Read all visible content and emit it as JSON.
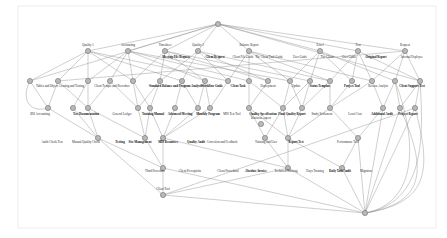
{
  "diagram": {
    "type": "concept-lattice",
    "background_color": "#ffffff",
    "node_fill": "#b9b9b9",
    "node_stroke": "#6e6e6e",
    "edge_color": "#8c8c8c",
    "border_color": "#e8e8e8",
    "node_radius": 2.6,
    "canvas": {
      "width": 447,
      "height": 238
    }
  },
  "layers": [
    {
      "name": "root",
      "y": 24
    },
    {
      "name": "level-1",
      "y": 51
    },
    {
      "name": "level-2",
      "y": 81
    },
    {
      "name": "level-3",
      "y": 108
    },
    {
      "name": "level-4",
      "y": 138
    },
    {
      "name": "level-5",
      "y": 168
    },
    {
      "name": "level-6",
      "y": 195
    },
    {
      "name": "bottom",
      "y": 213
    }
  ],
  "nodes": [
    {
      "id": "n0",
      "x": 218,
      "y": 24,
      "label": ""
    },
    {
      "id": "n1",
      "x": 88,
      "y": 51,
      "label": "Quality 1"
    },
    {
      "id": "n2",
      "x": 128,
      "y": 51,
      "label": "Accounting"
    },
    {
      "id": "n3",
      "x": 165,
      "y": 51,
      "label": "Timesheet"
    },
    {
      "id": "n4",
      "x": 198,
      "y": 51,
      "label": "Quality 2"
    },
    {
      "id": "n5",
      "x": 249,
      "y": 51,
      "label": "Balance Report"
    },
    {
      "id": "n6",
      "x": 320,
      "y": 51,
      "label": "Excel"
    },
    {
      "id": "n7",
      "x": 358,
      "y": 51,
      "label": "Test"
    },
    {
      "id": "n8",
      "x": 405,
      "y": 51,
      "label": "Request"
    },
    {
      "id": "m1",
      "x": 30,
      "y": 81,
      "label": ""
    },
    {
      "id": "m2",
      "x": 58,
      "y": 81,
      "label": ""
    },
    {
      "id": "m3",
      "x": 88,
      "y": 81,
      "label": ""
    },
    {
      "id": "m4",
      "x": 110,
      "y": 81,
      "label": ""
    },
    {
      "id": "m5",
      "x": 133,
      "y": 81,
      "label": ""
    },
    {
      "id": "m6",
      "x": 160,
      "y": 81,
      "label": ""
    },
    {
      "id": "m7",
      "x": 182,
      "y": 81,
      "label": ""
    },
    {
      "id": "m8",
      "x": 205,
      "y": 81,
      "label": ""
    },
    {
      "id": "m9",
      "x": 228,
      "y": 81,
      "label": ""
    },
    {
      "id": "m10",
      "x": 249,
      "y": 81,
      "label": ""
    },
    {
      "id": "m11",
      "x": 268,
      "y": 81,
      "label": ""
    },
    {
      "id": "m12",
      "x": 290,
      "y": 81,
      "label": ""
    },
    {
      "id": "m13",
      "x": 310,
      "y": 81,
      "label": ""
    },
    {
      "id": "m14",
      "x": 330,
      "y": 81,
      "label": ""
    },
    {
      "id": "m15",
      "x": 352,
      "y": 81,
      "label": ""
    },
    {
      "id": "m16",
      "x": 372,
      "y": 81,
      "label": ""
    },
    {
      "id": "m17",
      "x": 395,
      "y": 81,
      "label": ""
    },
    {
      "id": "m18",
      "x": 420,
      "y": 81,
      "label": ""
    },
    {
      "id": "p1",
      "x": 48,
      "y": 108,
      "label": ""
    },
    {
      "id": "p2",
      "x": 73,
      "y": 108,
      "label": ""
    },
    {
      "id": "p3",
      "x": 88,
      "y": 108,
      "label": ""
    },
    {
      "id": "p4",
      "x": 138,
      "y": 108,
      "label": ""
    },
    {
      "id": "p5",
      "x": 150,
      "y": 108,
      "label": ""
    },
    {
      "id": "p6",
      "x": 175,
      "y": 108,
      "label": ""
    },
    {
      "id": "p7",
      "x": 198,
      "y": 108,
      "label": ""
    },
    {
      "id": "p8",
      "x": 210,
      "y": 108,
      "label": ""
    },
    {
      "id": "p9",
      "x": 249,
      "y": 108,
      "label": ""
    },
    {
      "id": "p10",
      "x": 283,
      "y": 108,
      "label": ""
    },
    {
      "id": "p11",
      "x": 302,
      "y": 108,
      "label": ""
    },
    {
      "id": "p12",
      "x": 330,
      "y": 108,
      "label": ""
    },
    {
      "id": "p13",
      "x": 383,
      "y": 108,
      "label": ""
    },
    {
      "id": "p14",
      "x": 400,
      "y": 108,
      "label": ""
    },
    {
      "id": "p15",
      "x": 415,
      "y": 108,
      "label": ""
    },
    {
      "id": "q1",
      "x": 98,
      "y": 138,
      "label": ""
    },
    {
      "id": "q2",
      "x": 145,
      "y": 138,
      "label": ""
    },
    {
      "id": "q3",
      "x": 163,
      "y": 138,
      "label": ""
    },
    {
      "id": "q4",
      "x": 265,
      "y": 138,
      "label": ""
    },
    {
      "id": "q5",
      "x": 288,
      "y": 138,
      "label": ""
    },
    {
      "id": "q6",
      "x": 358,
      "y": 138,
      "label": ""
    },
    {
      "id": "r1",
      "x": 261,
      "y": 124,
      "label": "Business Aspect"
    },
    {
      "id": "s1",
      "x": 163,
      "y": 168,
      "label": ""
    },
    {
      "id": "s2",
      "x": 288,
      "y": 168,
      "label": ""
    },
    {
      "id": "s3",
      "x": 342,
      "y": 168,
      "label": ""
    },
    {
      "id": "t1",
      "x": 163,
      "y": 195,
      "label": "Client Tool"
    },
    {
      "id": "z1",
      "x": 365,
      "y": 213,
      "label": ""
    }
  ],
  "label_rows": [
    {
      "id": "row-top-wide",
      "y": 58,
      "items": [
        {
          "x": 176,
          "text": "Meeting File Request",
          "bold": true
        },
        {
          "x": 215,
          "text": "Client Request",
          "bold": true
        },
        {
          "x": 243,
          "text": "Client File Guide",
          "bold": false
        },
        {
          "x": 269,
          "text": "The Client Task Guide",
          "bold": false
        },
        {
          "x": 300,
          "text": "User Guide",
          "bold": false
        },
        {
          "x": 327,
          "text": "The Client",
          "bold": false
        },
        {
          "x": 349,
          "text": "User Guide",
          "bold": false
        },
        {
          "x": 376,
          "text": "Original Report",
          "bold": true
        },
        {
          "x": 412,
          "text": "Internal Deployee",
          "bold": false
        }
      ]
    },
    {
      "id": "row-mid-wide",
      "y": 87,
      "items": [
        {
          "x": 60,
          "text": "Tables and Object Creating and Testing",
          "bold": false
        },
        {
          "x": 112,
          "text": "Client Temple and Procedure",
          "bold": false
        },
        {
          "x": 155,
          "text": "Standard",
          "bold": true
        },
        {
          "x": 182,
          "text": "Balance and Program Analysis",
          "bold": true
        },
        {
          "x": 212,
          "text": "Workflow Guide",
          "bold": true
        },
        {
          "x": 238,
          "text": "Client Task",
          "bold": true
        },
        {
          "x": 268,
          "text": "Deployment",
          "bold": false
        },
        {
          "x": 296,
          "text": "Update",
          "bold": false
        },
        {
          "x": 320,
          "text": "Status Template",
          "bold": true
        },
        {
          "x": 352,
          "text": "Project Tool",
          "bold": true
        },
        {
          "x": 378,
          "text": "Release Analyst",
          "bold": false
        },
        {
          "x": 412,
          "text": "Client Support Test",
          "bold": true
        }
      ]
    },
    {
      "id": "row-level3",
      "y": 115,
      "items": [
        {
          "x": 40,
          "text": "BIS Accounting",
          "bold": false
        },
        {
          "x": 86,
          "text": "Test Documentation",
          "bold": true
        },
        {
          "x": 122,
          "text": "General Ledger",
          "bold": false
        },
        {
          "x": 153,
          "text": "Training Manual",
          "bold": true
        },
        {
          "x": 180,
          "text": "Advanced Meeting",
          "bold": true
        },
        {
          "x": 208,
          "text": "Monthly Program",
          "bold": true
        },
        {
          "x": 232,
          "text": "MIS Test Tool",
          "bold": false
        },
        {
          "x": 263,
          "text": "Quality Specification",
          "bold": true
        },
        {
          "x": 292,
          "text": "Final Quality Report",
          "bold": true
        },
        {
          "x": 322,
          "text": "Study Settlement",
          "bold": false
        },
        {
          "x": 355,
          "text": "Local Cost",
          "bold": false
        },
        {
          "x": 382,
          "text": "Additional Audit",
          "bold": true
        },
        {
          "x": 408,
          "text": "Project Report",
          "bold": true
        }
      ]
    },
    {
      "id": "row-level4",
      "y": 143,
      "items": [
        {
          "x": 52,
          "text": "Audit Check Test",
          "bold": false
        },
        {
          "x": 86,
          "text": "Manual Quality Check",
          "bold": false
        },
        {
          "x": 120,
          "text": "Testing",
          "bold": true
        },
        {
          "x": 140,
          "text": "Site Management",
          "bold": true
        },
        {
          "x": 168,
          "text": "MIS Resources",
          "bold": true
        },
        {
          "x": 196,
          "text": "Quality Audit",
          "bold": true
        },
        {
          "x": 222,
          "text": "Correction and Feedback",
          "bold": false
        },
        {
          "x": 266,
          "text": "Training and User",
          "bold": false
        },
        {
          "x": 296,
          "text": "Report Test",
          "bold": true
        },
        {
          "x": 348,
          "text": "Performance Tool",
          "bold": false
        }
      ]
    },
    {
      "id": "row-level5",
      "y": 172,
      "items": [
        {
          "x": 155,
          "text": "Third Procedure",
          "bold": false
        },
        {
          "x": 190,
          "text": "Client Prerequisite",
          "bold": false
        },
        {
          "x": 228,
          "text": "Client Procedural",
          "bold": false
        },
        {
          "x": 256,
          "text": "Absolute Invoice",
          "bold": true
        },
        {
          "x": 286,
          "text": "Technical Training",
          "bold": false
        },
        {
          "x": 315,
          "text": "Days Training",
          "bold": false
        },
        {
          "x": 340,
          "text": "Daily Task Audit",
          "bold": true
        },
        {
          "x": 366,
          "text": "Migration",
          "bold": false
        }
      ]
    }
  ],
  "edges": [
    [
      "n0",
      "n1"
    ],
    [
      "n0",
      "n2"
    ],
    [
      "n0",
      "n3"
    ],
    [
      "n0",
      "n4"
    ],
    [
      "n0",
      "n5"
    ],
    [
      "n0",
      "n6"
    ],
    [
      "n0",
      "n7"
    ],
    [
      "n0",
      "n8"
    ],
    [
      "n1",
      "m1"
    ],
    [
      "n1",
      "m3"
    ],
    [
      "n1",
      "m5"
    ],
    [
      "n1",
      "m7"
    ],
    [
      "n1",
      "m9"
    ],
    [
      "n1",
      "m2"
    ],
    [
      "n2",
      "m3"
    ],
    [
      "n2",
      "m5"
    ],
    [
      "n2",
      "m8"
    ],
    [
      "n2",
      "m10"
    ],
    [
      "n2",
      "m4"
    ],
    [
      "n2",
      "m12"
    ],
    [
      "n3",
      "m6"
    ],
    [
      "n3",
      "m8"
    ],
    [
      "n3",
      "m11"
    ],
    [
      "n3",
      "m13"
    ],
    [
      "n3",
      "m5"
    ],
    [
      "n4",
      "m7"
    ],
    [
      "n4",
      "m9"
    ],
    [
      "n4",
      "m11"
    ],
    [
      "n4",
      "m14"
    ],
    [
      "n4",
      "m6"
    ],
    [
      "n5",
      "m10"
    ],
    [
      "n5",
      "m12"
    ],
    [
      "n5",
      "m14"
    ],
    [
      "n5",
      "m16"
    ],
    [
      "n5",
      "m9"
    ],
    [
      "n6",
      "m13"
    ],
    [
      "n6",
      "m15"
    ],
    [
      "n6",
      "m17"
    ],
    [
      "n6",
      "m12"
    ],
    [
      "n7",
      "m15"
    ],
    [
      "n7",
      "m16"
    ],
    [
      "n7",
      "m18"
    ],
    [
      "n7",
      "m14"
    ],
    [
      "n8",
      "m17"
    ],
    [
      "n8",
      "m18"
    ],
    [
      "n8",
      "m16"
    ],
    [
      "n8",
      "m2"
    ],
    [
      "n0",
      "m1"
    ],
    [
      "n0",
      "m18"
    ],
    [
      "m1",
      "p1"
    ],
    [
      "m2",
      "p1"
    ],
    [
      "m3",
      "p2"
    ],
    [
      "m3",
      "p3"
    ],
    [
      "m4",
      "p3"
    ],
    [
      "m5",
      "p4"
    ],
    [
      "m6",
      "p5"
    ],
    [
      "m6",
      "p4"
    ],
    [
      "m7",
      "p6"
    ],
    [
      "m7",
      "p7"
    ],
    [
      "m8",
      "p7"
    ],
    [
      "m9",
      "p8"
    ],
    [
      "m10",
      "p9"
    ],
    [
      "m11",
      "p9"
    ],
    [
      "m12",
      "p10"
    ],
    [
      "m13",
      "p10"
    ],
    [
      "m13",
      "p11"
    ],
    [
      "m14",
      "p11"
    ],
    [
      "m15",
      "p12"
    ],
    [
      "m16",
      "p12"
    ],
    [
      "m17",
      "p13"
    ],
    [
      "m18",
      "p14"
    ],
    [
      "m18",
      "p15"
    ],
    [
      "m2",
      "p3"
    ],
    [
      "m4",
      "p4"
    ],
    [
      "m5",
      "p5"
    ],
    [
      "m8",
      "p8"
    ],
    [
      "m10",
      "p10"
    ],
    [
      "m12",
      "p11"
    ],
    [
      "m14",
      "p12"
    ],
    [
      "m16",
      "p13"
    ],
    [
      "m17",
      "p14"
    ],
    [
      "p1",
      "q1"
    ],
    [
      "p2",
      "q1"
    ],
    [
      "p3",
      "q1"
    ],
    [
      "p4",
      "q2"
    ],
    [
      "p5",
      "q2"
    ],
    [
      "p5",
      "q3"
    ],
    [
      "p6",
      "q3"
    ],
    [
      "p7",
      "q3"
    ],
    [
      "p8",
      "q3"
    ],
    [
      "p9",
      "q4"
    ],
    [
      "p10",
      "q4"
    ],
    [
      "p10",
      "q5"
    ],
    [
      "p11",
      "q5"
    ],
    [
      "p12",
      "q6"
    ],
    [
      "p13",
      "q6"
    ],
    [
      "p14",
      "z1"
    ],
    [
      "p15",
      "z1"
    ],
    [
      "p3",
      "q2"
    ],
    [
      "p9",
      "q5"
    ],
    [
      "p12",
      "q5"
    ],
    [
      "p13",
      "z1"
    ],
    [
      "q1",
      "s1"
    ],
    [
      "q2",
      "s1"
    ],
    [
      "q3",
      "s1"
    ],
    [
      "q4",
      "s2"
    ],
    [
      "q5",
      "s2"
    ],
    [
      "q6",
      "s3"
    ],
    [
      "q3",
      "s2"
    ],
    [
      "q5",
      "s3"
    ],
    [
      "s1",
      "t1"
    ],
    [
      "s2",
      "t1"
    ],
    [
      "s1",
      "z1"
    ],
    [
      "s2",
      "z1"
    ],
    [
      "s3",
      "z1"
    ],
    [
      "t1",
      "z1"
    ],
    [
      "q1",
      "t1"
    ],
    [
      "q6",
      "z1"
    ],
    [
      "p15",
      "t1"
    ]
  ]
}
